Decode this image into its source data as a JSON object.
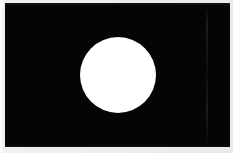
{
  "figure": {
    "title": "Black rectangle with centered white circle",
    "caption": "",
    "width_px": 233,
    "height_px": 153
  },
  "canvas": {
    "name": "figure-canvas",
    "background_color": "#f3f2f0",
    "width_px": 233,
    "height_px": 153
  },
  "paper": {
    "name": "paper-backdrop",
    "color": "#f2f1ef",
    "description": "light scanned paper margin surrounding the black field"
  },
  "black_field": {
    "name": "black-field",
    "color": "#050505",
    "left_px": 5,
    "top_px": 3,
    "width_px": 225,
    "height_px": 144
  },
  "shape": {
    "name": "white-circle",
    "type": "circle",
    "fill_color": "#ffffff",
    "center_x_px": 118,
    "center_y_px": 75,
    "diameter_px": 76,
    "radius_px": 38,
    "left_px": 80,
    "top_px": 37
  },
  "artifacts": {
    "scan_seam": {
      "name": "scan-seam",
      "left_px": 206,
      "width_px": 2,
      "color": "#222222",
      "description": "faint vertical scan line artifact in the right portion of the black field"
    }
  }
}
